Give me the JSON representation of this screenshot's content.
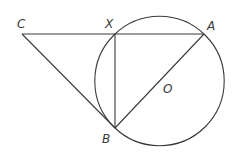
{
  "diagram": {
    "type": "geometry",
    "points": {
      "C": {
        "label": "C"
      },
      "X": {
        "label": "X"
      },
      "A": {
        "label": "A"
      },
      "B": {
        "label": "B"
      },
      "O": {
        "label": "O"
      }
    },
    "segments": [
      "CX",
      "XA",
      "CB",
      "XB",
      "AB"
    ],
    "circle": {
      "center": "O",
      "through": [
        "A",
        "X",
        "B"
      ]
    },
    "stroke_color": "#3a3a3a"
  }
}
